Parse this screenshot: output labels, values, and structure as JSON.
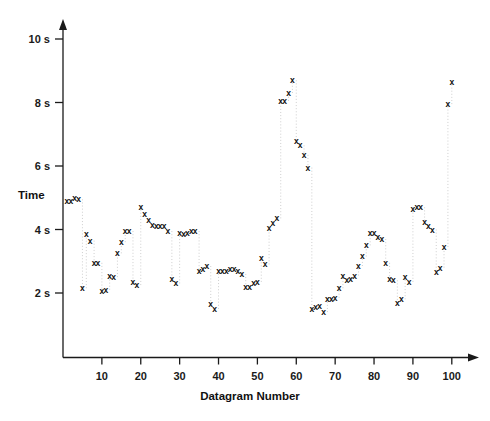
{
  "chart_data": {
    "type": "scatter",
    "title": "",
    "xlabel": "Datagram Number",
    "ylabel": "Time",
    "xlim": [
      0,
      104
    ],
    "ylim": [
      0,
      10.4
    ],
    "grid": false,
    "legend": null,
    "marker_glyph": "x",
    "marker_color": "#0d0d0d",
    "connector_style": "dotted-vertical-light",
    "connector_color": "#c9c9c9",
    "axis_color": "#1a1a1a",
    "xticks": [
      10,
      20,
      30,
      40,
      50,
      60,
      70,
      80,
      90,
      100
    ],
    "xtick_labels": [
      "10",
      "20",
      "30",
      "40",
      "50",
      "60",
      "70",
      "80",
      "90",
      "100"
    ],
    "yticks": [
      2,
      4,
      6,
      8,
      10
    ],
    "ytick_labels": [
      "2 s",
      "4 s",
      "6 s",
      "8 s",
      "10 s"
    ],
    "x": [
      1,
      2,
      3,
      4,
      5,
      6,
      7,
      8,
      9,
      10,
      11,
      12,
      13,
      14,
      15,
      16,
      17,
      18,
      19,
      20,
      21,
      22,
      23,
      24,
      25,
      26,
      27,
      28,
      29,
      30,
      31,
      32,
      33,
      34,
      35,
      36,
      37,
      38,
      39,
      40,
      41,
      42,
      43,
      44,
      45,
      46,
      47,
      48,
      49,
      50,
      51,
      52,
      53,
      54,
      55,
      56,
      57,
      58,
      59,
      60,
      61,
      62,
      63,
      64,
      65,
      66,
      67,
      68,
      69,
      70,
      71,
      72,
      73,
      74,
      75,
      76,
      77,
      78,
      79,
      80,
      81,
      82,
      83,
      84,
      85,
      86,
      87,
      88,
      89,
      90,
      91,
      92,
      93,
      94,
      95,
      96,
      97,
      98,
      99,
      100
    ],
    "y": [
      4.9,
      4.9,
      5.0,
      4.95,
      2.15,
      3.85,
      3.65,
      2.95,
      2.95,
      2.05,
      2.1,
      2.55,
      2.5,
      3.25,
      3.6,
      3.95,
      3.95,
      2.35,
      2.25,
      4.7,
      4.5,
      4.3,
      4.15,
      4.1,
      4.1,
      4.1,
      3.95,
      2.45,
      2.3,
      3.9,
      3.85,
      3.9,
      3.95,
      3.95,
      2.7,
      2.75,
      2.85,
      1.65,
      1.5,
      2.7,
      2.7,
      2.7,
      2.75,
      2.75,
      2.7,
      2.6,
      2.2,
      2.2,
      2.3,
      2.35,
      3.1,
      2.9,
      4.05,
      4.2,
      4.35,
      8.05,
      8.05,
      8.3,
      8.7,
      6.8,
      6.65,
      6.35,
      5.95,
      1.5,
      1.55,
      1.6,
      1.4,
      1.8,
      1.8,
      1.85,
      2.15,
      2.55,
      2.4,
      2.45,
      2.55,
      2.85,
      3.15,
      3.5,
      3.9,
      3.9,
      3.75,
      3.7,
      2.95,
      2.45,
      2.4,
      1.7,
      1.8,
      2.5,
      2.35,
      4.65,
      4.7,
      4.7,
      4.25,
      4.1,
      4.0,
      2.65,
      2.8,
      3.45,
      7.95,
      8.65
    ],
    "units": "s",
    "point_count": 100,
    "value_min": 1.4,
    "value_max": 8.7
  },
  "axes": {
    "x_axis_title": "Datagram Number",
    "y_axis_title": "Time"
  }
}
